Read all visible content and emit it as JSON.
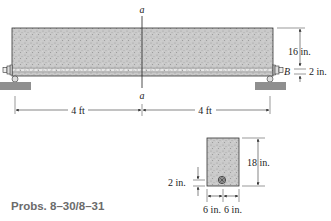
{
  "diagram": {
    "type": "beam-elevation-and-cross-section",
    "colors": {
      "concrete_fill": "#c9c9c9",
      "concrete_speckle": "#9a9a9a",
      "outline": "#333333",
      "support": "#8f8f8f",
      "rebar_dash": "#ffffff"
    },
    "elevation": {
      "section_label_top": "a",
      "section_label_bottom": "a",
      "height_dim": "16 in.",
      "cover_dim": "2 in.",
      "point_label": "B",
      "span_left": "4 ft",
      "span_right": "4 ft"
    },
    "cross_section": {
      "height_dim": "18 in.",
      "cover_dim": "2 in.",
      "width_left": "6 in.",
      "width_right": "6 in."
    }
  },
  "caption": "Probs. 8–30/8–31"
}
